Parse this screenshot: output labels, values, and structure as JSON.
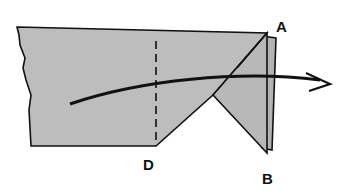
{
  "figure": {
    "type": "folding-diagram",
    "labels": {
      "a": "A",
      "b": "B",
      "d": "D"
    },
    "colors": {
      "paper": "#bdbdbd",
      "paper_back": "#b0b0b0",
      "outline": "#111111",
      "arrow": "#111111"
    }
  }
}
